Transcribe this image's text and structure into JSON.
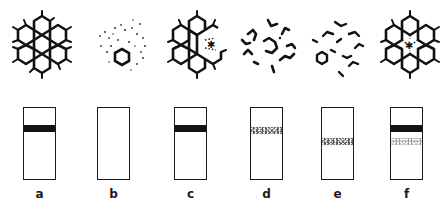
{
  "figure": {
    "panels": [
      {
        "label": "a",
        "molecule": "intact-coronene",
        "band": {
          "type": "solid",
          "top": 17
        },
        "band2": null
      },
      {
        "label": "b",
        "molecule": "dispersed-fragments-with-ring",
        "band": null,
        "band2": null
      },
      {
        "label": "c",
        "molecule": "coronene-partial-defect",
        "band": {
          "type": "solid",
          "top": 17
        },
        "band2": null
      },
      {
        "label": "d",
        "molecule": "broken-fragments-central-ring",
        "band": {
          "type": "speckled",
          "top": 19
        },
        "band2": null
      },
      {
        "label": "e",
        "molecule": "scattered-fragments",
        "band": {
          "type": "speckled",
          "top": 30
        },
        "band2": null
      },
      {
        "label": "f",
        "molecule": "ring-with-center-defect",
        "band": {
          "type": "solid",
          "top": 17
        },
        "band2": {
          "type": "light",
          "top": 30
        }
      }
    ],
    "colors": {
      "ink": "#1a1a1a",
      "background": "#ffffff"
    }
  }
}
